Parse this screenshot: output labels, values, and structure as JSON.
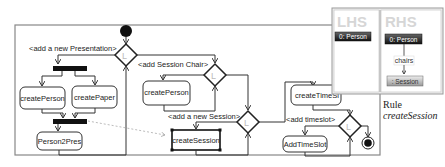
{
  "diagram": {
    "guards": {
      "presentation": "<add a new Presentation>",
      "session_chair": "<add Session Chair>",
      "new_session": "<add a new Session>",
      "timeslot": "<add timeslot>"
    },
    "activities": {
      "create_person_1": "createPerson",
      "create_paper": "createPaper",
      "person2pres": "Person2Pres",
      "create_person_2": "createPerson",
      "create_session": "createSession",
      "create_timeslot": "createTimeSl",
      "add_timeslot": "AddTimeSlot"
    },
    "decision_label": "L",
    "rule_panel": {
      "lhs_title": "LHS",
      "rhs_title": "RHS",
      "lhs_node": "0: Person",
      "rhs_node_person": "0: Person",
      "rhs_edge": "chairs",
      "rhs_node_session": ": Session"
    },
    "caption": {
      "line1": "Rule",
      "line2": "createSession"
    }
  }
}
